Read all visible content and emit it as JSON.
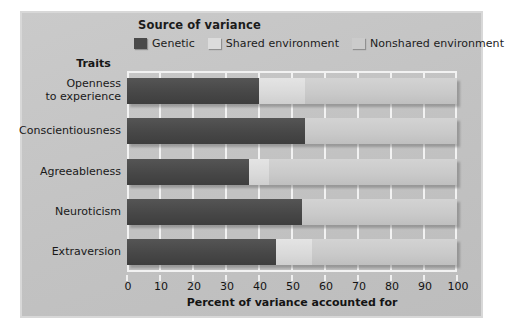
{
  "figure": {
    "background_color": "#ffffff",
    "panel_color": "#c5c5c5",
    "panel_border_color": "#d8d8d8"
  },
  "legend": {
    "title": "Source of variance",
    "items": [
      {
        "label": "Genetic",
        "color": "#4a4a4a",
        "swatch_name": "legend-swatch-genetic"
      },
      {
        "label": "Shared environment",
        "color": "#dcdcdc",
        "swatch_name": "legend-swatch-shared-environment"
      },
      {
        "label": "Nonshared environment",
        "color": "#cbcbcb",
        "swatch_name": "legend-swatch-nonshared-environment"
      }
    ]
  },
  "axes": {
    "traits_header": "Traits",
    "xlabel": "Percent of variance accounted for",
    "xticks": [
      "0",
      "10",
      "20",
      "30",
      "40",
      "50",
      "60",
      "70",
      "80",
      "90",
      "100"
    ]
  },
  "chart_data": {
    "type": "bar",
    "orientation": "horizontal",
    "stacked": true,
    "title": "",
    "xlabel": "Percent of variance accounted for",
    "ylabel": "Traits",
    "xlim": [
      0,
      100
    ],
    "xticks": [
      0,
      10,
      20,
      30,
      40,
      50,
      60,
      70,
      80,
      90,
      100
    ],
    "grid": true,
    "legend_title": "Source of variance",
    "legend_position": "top-left",
    "categories": [
      "Openness\nto experience",
      "Conscientiousness",
      "Agreeableness",
      "Neuroticism",
      "Extraversion"
    ],
    "series": [
      {
        "name": "Genetic",
        "color": "#4a4a4a",
        "values": [
          40,
          54,
          37,
          53,
          45
        ]
      },
      {
        "name": "Shared environment",
        "color": "#dcdcdc",
        "values": [
          14,
          0,
          6,
          0,
          11
        ]
      },
      {
        "name": "Nonshared environment",
        "color": "#cbcbcb",
        "values": [
          46,
          46,
          57,
          47,
          44
        ]
      }
    ]
  }
}
